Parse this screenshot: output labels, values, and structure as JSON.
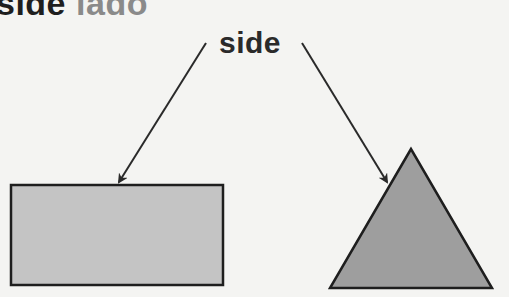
{
  "header": {
    "term_english": "side",
    "term_spanish": "lado"
  },
  "diagram": {
    "label": "side",
    "shapes": [
      {
        "name": "rectangle",
        "fill": "#c4c4c4",
        "stroke": "#1e1e1e"
      },
      {
        "name": "triangle",
        "fill": "#9e9e9e",
        "stroke": "#1e1e1e"
      }
    ],
    "arrow_color": "#2a2a2a"
  }
}
